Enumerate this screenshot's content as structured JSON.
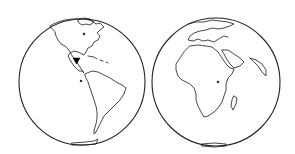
{
  "map": {
    "type": "orthographic-globes",
    "background": "#ffffff",
    "line_color": "#1a1a1a",
    "globes": [
      {
        "name": "western-hemisphere",
        "depicts": [
          "North America",
          "Central America",
          "South America",
          "Greenland",
          "Caribbean",
          "Antarctica"
        ],
        "center": [
          82,
          82
        ],
        "radius": 63
      },
      {
        "name": "eastern-hemisphere",
        "depicts": [
          "Africa",
          "Europe",
          "Arabian Peninsula",
          "India",
          "Madagascar",
          "Antarctica"
        ],
        "center": [
          216,
          82
        ],
        "radius": 64
      }
    ],
    "marker": {
      "shape": "inverted-triangle",
      "color": "#000000",
      "location": "Central America (Honduras region)",
      "position": [
        76,
        60
      ]
    }
  }
}
